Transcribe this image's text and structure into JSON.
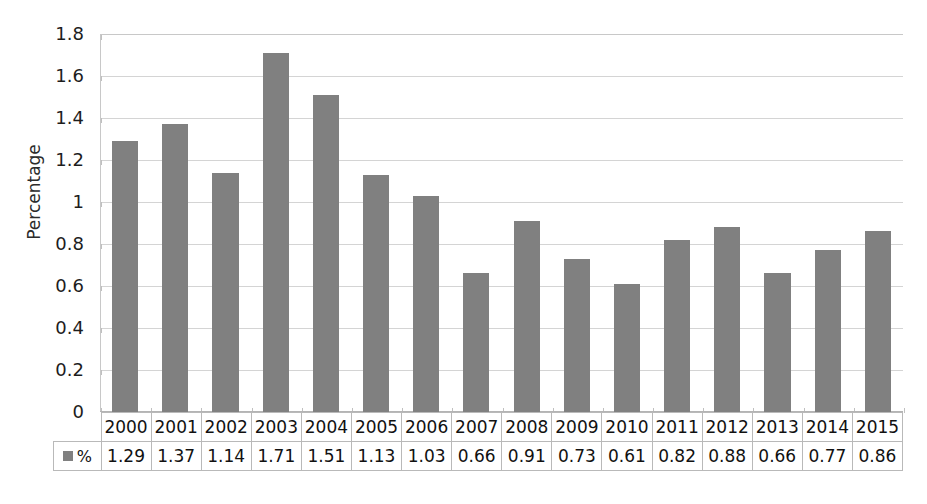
{
  "chart_data": {
    "type": "bar",
    "title": "",
    "xlabel": "",
    "ylabel": "Percentage",
    "ylim": [
      0,
      1.8
    ],
    "ytick_step": 0.2,
    "yticks": [
      "1.8",
      "1.6",
      "1.4",
      "1.2",
      "1",
      "0.8",
      "0.6",
      "0.4",
      "0.2",
      "0"
    ],
    "grid": true,
    "legend_position": "data-table-row",
    "categories": [
      "2000",
      "2001",
      "2002",
      "2003",
      "2004",
      "2005",
      "2006",
      "2007",
      "2008",
      "2009",
      "2010",
      "2011",
      "2012",
      "2013",
      "2014",
      "2015"
    ],
    "series": [
      {
        "name": "%",
        "values": [
          1.29,
          1.37,
          1.14,
          1.71,
          1.51,
          1.13,
          1.03,
          0.66,
          0.91,
          0.73,
          0.61,
          0.82,
          0.88,
          0.66,
          0.77,
          0.86
        ]
      }
    ],
    "value_labels": [
      "1.29",
      "1.37",
      "1.14",
      "1.71",
      "1.51",
      "1.13",
      "1.03",
      "0.66",
      "0.91",
      "0.73",
      "0.61",
      "0.82",
      "0.88",
      "0.66",
      "0.77",
      "0.86"
    ]
  },
  "legend": {
    "series_label": "%",
    "swatch_name": "legend-swatch-percentage"
  },
  "colors": {
    "bar_fill": "#808080",
    "gridline": "#d4d4d4",
    "axis_line": "#c8c8c8",
    "table_border": "#b9b9b9",
    "text": "#1a1a1a",
    "background": "#ffffff"
  }
}
